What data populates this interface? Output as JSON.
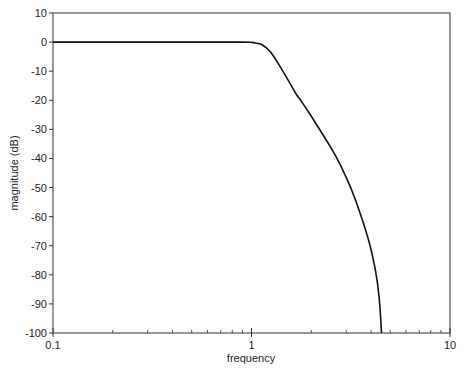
{
  "chart_data": {
    "type": "line",
    "title": "",
    "xlabel": "frequency",
    "ylabel": "magnitude (dB)",
    "xscale": "log",
    "xlim": [
      0.1,
      10
    ],
    "ylim": [
      -100,
      10
    ],
    "xticks": [
      "0.1",
      "1",
      "10"
    ],
    "yticks": [
      "10",
      "0",
      "-10",
      "-20",
      "-30",
      "-40",
      "-50",
      "-60",
      "-70",
      "-80",
      "-90",
      "-100"
    ],
    "grid": false,
    "legend": null,
    "series": [
      {
        "name": "magnitude",
        "color": "#111111",
        "x": [
          0.1,
          0.3,
          0.6,
          0.9,
          1.0,
          1.05,
          1.136,
          1.247,
          1.4,
          1.666,
          1.765,
          2.0,
          2.59,
          3.0,
          3.34,
          3.89,
          4.21,
          4.4,
          4.52
        ],
        "y": [
          0,
          0,
          0,
          0,
          -0.1,
          -0.3,
          -1.0,
          -3.4,
          -8.6,
          -17.5,
          -19.9,
          -25.5,
          -37.8,
          -46.5,
          -54.3,
          -68.1,
          -78.4,
          -88,
          -100
        ]
      }
    ]
  }
}
